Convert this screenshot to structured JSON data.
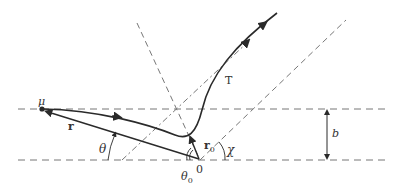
{
  "diagram": {
    "type": "scattering-trajectory",
    "labels": {
      "mu": "μ",
      "r": "r",
      "theta": "θ",
      "theta0": "θ",
      "theta0_sub": "0",
      "r0": "r",
      "r0_sub": "0",
      "origin": "0",
      "chi": "χ",
      "T": "T",
      "b": "b"
    },
    "colors": {
      "stroke": "#2a2a2a",
      "dashed": "#777777",
      "background": "#ffffff"
    }
  }
}
